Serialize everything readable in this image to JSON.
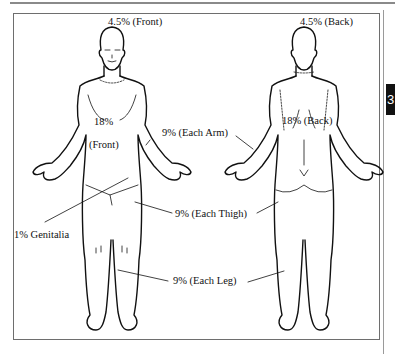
{
  "page": {
    "section_tab": "3"
  },
  "diagram": {
    "figures": [
      "front-view",
      "back-view"
    ],
    "labels": {
      "head_front": "4.5% (Front)",
      "head_back": "4.5% (Back)",
      "trunk_front_value": "18%",
      "trunk_front_side": "(Front)",
      "trunk_back": "18% (Back)",
      "arm": "9% (Each Arm)",
      "genitalia": "1% Genitalia",
      "thigh": "9% (Each Thigh)",
      "leg": "9% (Each Leg)"
    },
    "colors": {
      "line": "#111111",
      "frame": "#6e6e6e",
      "tab_bg": "#111111",
      "tab_text": "#ffffff"
    }
  }
}
